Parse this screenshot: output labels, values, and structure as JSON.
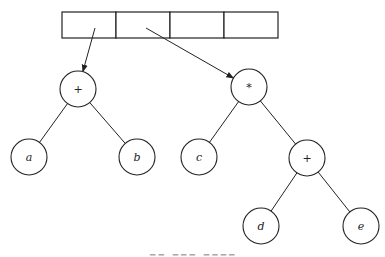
{
  "diagram": {
    "array": {
      "cells": 4,
      "x": 62,
      "y": 12,
      "cell_width": 54,
      "height": 26
    },
    "nodes": [
      {
        "id": "plus1",
        "label": "+",
        "x": 78,
        "y": 89,
        "italic": false
      },
      {
        "id": "a",
        "label": "a",
        "x": 29,
        "y": 157,
        "italic": true
      },
      {
        "id": "b",
        "label": "b",
        "x": 137,
        "y": 157,
        "italic": true
      },
      {
        "id": "times",
        "label": "*",
        "x": 249,
        "y": 87,
        "italic": false
      },
      {
        "id": "c",
        "label": "c",
        "x": 199,
        "y": 157,
        "italic": true
      },
      {
        "id": "plus2",
        "label": "+",
        "x": 307,
        "y": 158,
        "italic": false
      },
      {
        "id": "d",
        "label": "d",
        "x": 261,
        "y": 226,
        "italic": true
      },
      {
        "id": "e",
        "label": "e",
        "x": 361,
        "y": 226,
        "italic": true
      }
    ],
    "edges": [
      [
        "plus1",
        "a"
      ],
      [
        "plus1",
        "b"
      ],
      [
        "times",
        "c"
      ],
      [
        "times",
        "plus2"
      ],
      [
        "plus2",
        "d"
      ],
      [
        "plus2",
        "e"
      ]
    ],
    "pointers": [
      {
        "from": [
          95,
          28
        ],
        "to": "plus1"
      },
      {
        "from": [
          146,
          28
        ],
        "to": "times"
      }
    ],
    "radius": 18,
    "stroke": "#222222"
  }
}
